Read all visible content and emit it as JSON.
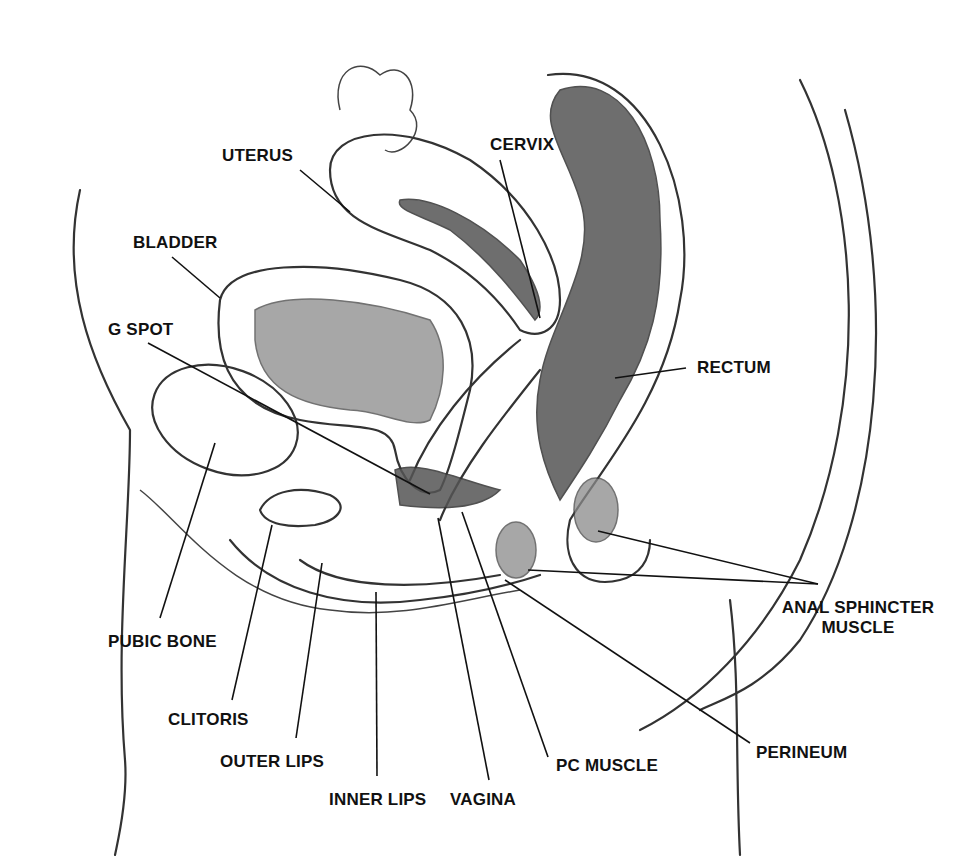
{
  "diagram": {
    "type": "anatomy-sagittal-section",
    "background": "#ffffff",
    "ink_color": "#111111",
    "labels": [
      {
        "id": "uterus",
        "text": "UTERUS",
        "x": 222,
        "y": 146,
        "leader": [
          [
            300,
            170
          ],
          [
            350,
            212
          ]
        ]
      },
      {
        "id": "cervix",
        "text": "CERVIX",
        "x": 490,
        "y": 135,
        "leader": [
          [
            500,
            160
          ],
          [
            540,
            318
          ]
        ]
      },
      {
        "id": "bladder",
        "text": "BLADDER",
        "x": 133,
        "y": 233,
        "leader": [
          [
            172,
            257
          ],
          [
            220,
            298
          ]
        ]
      },
      {
        "id": "g-spot",
        "text": "G SPOT",
        "x": 108,
        "y": 320,
        "leader": [
          [
            148,
            343
          ],
          [
            430,
            494
          ]
        ]
      },
      {
        "id": "rectum",
        "text": "RECTUM",
        "x": 697,
        "y": 358,
        "leader": [
          [
            686,
            368
          ],
          [
            615,
            378
          ]
        ]
      },
      {
        "id": "anal-sphincter-muscle",
        "text": "ANAL SPHINCTER",
        "text2": "MUSCLE",
        "x": 758,
        "y": 598,
        "leader": [
          [
            818,
            584
          ],
          [
            598,
            531
          ]
        ],
        "leader2": [
          [
            818,
            584
          ],
          [
            528,
            570
          ]
        ]
      },
      {
        "id": "pubic-bone",
        "text": "PUBIC BONE",
        "x": 108,
        "y": 632,
        "leader": [
          [
            160,
            618
          ],
          [
            215,
            443
          ]
        ]
      },
      {
        "id": "clitoris",
        "text": "CLITORIS",
        "x": 168,
        "y": 710,
        "leader": [
          [
            232,
            700
          ],
          [
            272,
            525
          ]
        ]
      },
      {
        "id": "perineum",
        "text": "PERINEUM",
        "x": 756,
        "y": 743,
        "leader": [
          [
            750,
            743
          ],
          [
            505,
            580
          ]
        ]
      },
      {
        "id": "outer-lips",
        "text": "OUTER LIPS",
        "x": 220,
        "y": 752,
        "leader": [
          [
            296,
            738
          ],
          [
            322,
            563
          ]
        ]
      },
      {
        "id": "pc-muscle",
        "text": "PC MUSCLE",
        "x": 556,
        "y": 756,
        "leader": [
          [
            548,
            757
          ],
          [
            462,
            512
          ]
        ]
      },
      {
        "id": "inner-lips",
        "text": "INNER LIPS",
        "x": 329,
        "y": 790,
        "leader": [
          [
            377,
            776
          ],
          [
            376,
            592
          ]
        ]
      },
      {
        "id": "vagina",
        "text": "VAGINA",
        "x": 450,
        "y": 790,
        "leader": [
          [
            489,
            780
          ],
          [
            438,
            518
          ]
        ]
      }
    ]
  }
}
